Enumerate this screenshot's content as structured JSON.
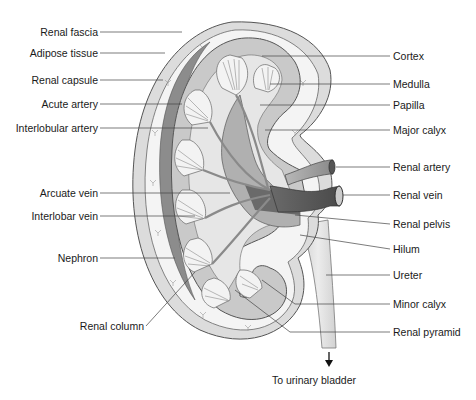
{
  "diagram": {
    "left_labels": [
      {
        "text": "Renal fascia",
        "y": 32
      },
      {
        "text": "Adipose tissue",
        "y": 53
      },
      {
        "text": "Renal capsule",
        "y": 80
      },
      {
        "text": "Acute artery",
        "y": 104
      },
      {
        "text": "Interlobular artery",
        "y": 128
      },
      {
        "text": "Arcuate vein",
        "y": 193
      },
      {
        "text": "Interlobar vein",
        "y": 216
      },
      {
        "text": "Nephron",
        "y": 258
      },
      {
        "text": "Renal column",
        "y": 326
      }
    ],
    "right_labels": [
      {
        "text": "Cortex",
        "y": 56
      },
      {
        "text": "Medulla",
        "y": 84
      },
      {
        "text": "Papilla",
        "y": 105
      },
      {
        "text": "Major calyx",
        "y": 130
      },
      {
        "text": "Renal artery",
        "y": 167
      },
      {
        "text": "Renal vein",
        "y": 195
      },
      {
        "text": "Renal pelvis",
        "y": 224
      },
      {
        "text": "Hilum",
        "y": 249
      },
      {
        "text": "Ureter",
        "y": 275
      },
      {
        "text": "Minor calyx",
        "y": 304
      },
      {
        "text": "Renal pyramid",
        "y": 332
      }
    ],
    "bottom_caption": "To urinary bladder",
    "colors": {
      "line": "#444444",
      "fascia": "#d8d8d8",
      "adipose": "#f2f2f2",
      "capsule": "#8c8c8c",
      "cortex": "#c8c8c8",
      "medulla": "#eeeeee",
      "vessel_dark": "#5a5a5a",
      "vessel_mid": "#9a9a9a",
      "ureter": "#dcdcdc"
    }
  }
}
